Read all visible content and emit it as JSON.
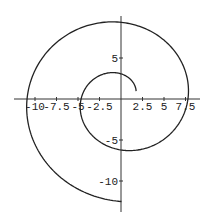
{
  "chart_data": {
    "type": "line",
    "subtype": "parametric-polar-spiral",
    "title": "",
    "xlabel": "",
    "ylabel": "",
    "curve": {
      "polar": "r = theta + 1.5",
      "theta_range": [
        0.5,
        11.0
      ]
    },
    "x_tick_labels": [
      "-10",
      "-7.5",
      "-5",
      "-2.5",
      "2.5",
      "5",
      "7.5"
    ],
    "x_ticks": [
      -10,
      -7.5,
      -5,
      -2.5,
      2.5,
      5,
      7.5
    ],
    "y_tick_labels": [
      "5",
      "-5",
      "-10"
    ],
    "y_ticks": [
      5,
      -5,
      -10
    ],
    "xlim": [
      -12.5,
      9
    ],
    "ylim": [
      -12.8,
      9.6
    ],
    "key_points": [
      {
        "x": 2.0,
        "y": 0
      },
      {
        "x": 0,
        "y": 3.1
      },
      {
        "x": -4.7,
        "y": 0
      },
      {
        "x": 0,
        "y": -6.2
      },
      {
        "x": 8.6,
        "y": 0
      },
      {
        "x": 0,
        "y": 9.4
      },
      {
        "x": -12.2,
        "y": 0
      },
      {
        "x": 0,
        "y": -12.6
      }
    ],
    "grid": false,
    "legend": null,
    "line_color": "#222222"
  }
}
